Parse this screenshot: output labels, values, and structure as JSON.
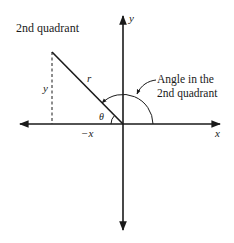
{
  "diagram": {
    "title_label": "2nd quadrant",
    "annotation_line1": "Angle in the",
    "annotation_line2": "2nd quadrant",
    "labels": {
      "y_axis": "y",
      "x_axis": "x",
      "neg_x": "−x",
      "y_leg": "y",
      "radius": "r",
      "theta": "θ"
    },
    "colors": {
      "stroke": "#1a1a1a",
      "background": "#ffffff"
    }
  }
}
